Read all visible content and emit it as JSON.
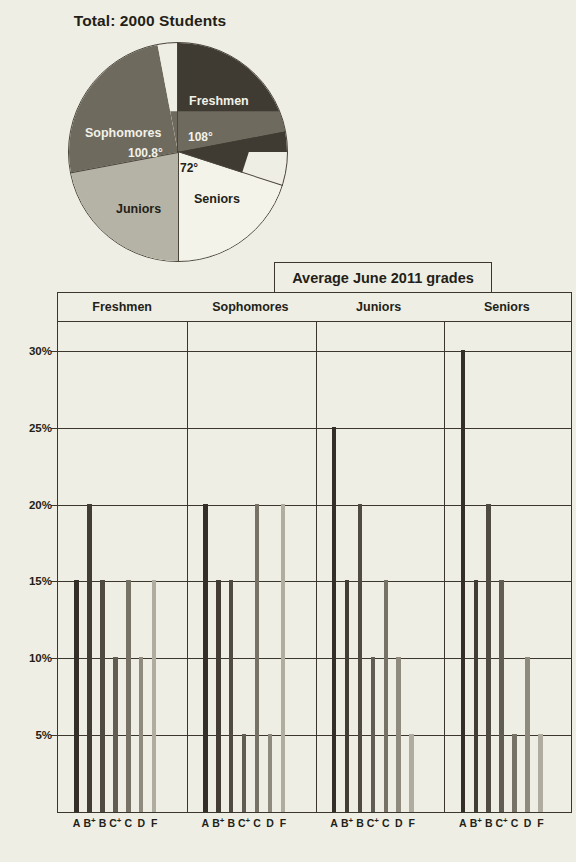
{
  "pie": {
    "title": "Total:  2000 Students",
    "slices": [
      {
        "label": "Freshmen",
        "angle_text": "108°",
        "angle": 108,
        "color": "#3f3b33"
      },
      {
        "label": "Seniors",
        "angle_text": "72°",
        "angle": 72,
        "color": "#f4f3ea"
      },
      {
        "label": "Juniors",
        "angle_text": "",
        "angle": 79.2,
        "color": "#b5b3a6"
      },
      {
        "label": "Sophomores",
        "angle_text": "100.8°",
        "angle": 100.8,
        "color": "#6e6a5e"
      }
    ]
  },
  "bar_chart": {
    "title": "Average June 2011 grades",
    "y_ticks": [
      "30%",
      "25%",
      "20%",
      "15%",
      "10%",
      "5%"
    ],
    "groups": [
      "Freshmen",
      "Sophomores",
      "Juniors",
      "Seniors"
    ],
    "grade_labels": [
      "A",
      "B",
      "B",
      "C",
      "C",
      "D",
      "F"
    ],
    "grade_sups": [
      "",
      "+",
      "",
      "+",
      "",
      "",
      ""
    ],
    "bar_colors": [
      "#332f28",
      "#413d35",
      "#4f4b42",
      "#615d53",
      "#767266",
      "#8e8a7d",
      "#b0ada0"
    ]
  },
  "chart_data": [
    {
      "type": "pie",
      "title": "Total:  2000 Students",
      "labels": [
        "Freshmen",
        "Sophomores",
        "Juniors",
        "Seniors"
      ],
      "angles_deg": [
        108,
        100.8,
        79.2,
        72
      ],
      "annotations": [
        "108°",
        "100.8°",
        "",
        "72°"
      ],
      "total": 2000,
      "unit": "Students",
      "legend": "none"
    },
    {
      "type": "bar",
      "title": "Average June 2011 grades",
      "xlabel": "",
      "ylabel": "",
      "ylim": [
        0,
        30
      ],
      "ytick_values": [
        30,
        25,
        20,
        15,
        10,
        5
      ],
      "grid": true,
      "grid_axis": "y",
      "categories": [
        "A",
        "B+",
        "B",
        "C+",
        "C",
        "D",
        "F"
      ],
      "groups": [
        "Freshmen",
        "Sophomores",
        "Juniors",
        "Seniors"
      ],
      "series": [
        {
          "name": "Freshmen",
          "values": [
            15,
            20,
            15,
            10,
            15,
            10,
            15
          ]
        },
        {
          "name": "Sophomores",
          "values": [
            20,
            15,
            15,
            5,
            20,
            5,
            20
          ]
        },
        {
          "name": "Juniors",
          "values": [
            25,
            15,
            20,
            10,
            15,
            10,
            5
          ]
        },
        {
          "name": "Seniors",
          "values": [
            30,
            15,
            20,
            15,
            5,
            10,
            5
          ]
        }
      ],
      "legend": "none",
      "note": "Seniors A bar reaches the top of the plot area (30% or greater)."
    }
  ]
}
